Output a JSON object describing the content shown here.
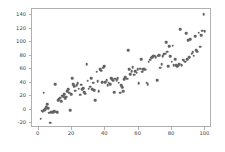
{
  "chart_data": {
    "type": "scatter",
    "title": "",
    "xlabel": "",
    "ylabel": "",
    "xlim": [
      -4.0,
      104.0
    ],
    "ylim": [
      -27.0,
      149.0
    ],
    "xticks": [
      0,
      20,
      40,
      60,
      80,
      100
    ],
    "yticks": [
      -20,
      0,
      20,
      40,
      60,
      80,
      100,
      120,
      140
    ],
    "xticklabels": [
      "0",
      "20",
      "40",
      "60",
      "80",
      "100"
    ],
    "yticklabels": [
      "-20",
      "0",
      "20",
      "40",
      "60",
      "80",
      "100",
      "120",
      "140"
    ],
    "grid": false,
    "legend": null,
    "marker": {
      "shape": "circle",
      "color": "#636363",
      "size": 2.6
    },
    "n_points": 150,
    "x": [
      1.2,
      1.8,
      2.4,
      3.0,
      3.4,
      4.0,
      4.6,
      5.2,
      5.8,
      6.2,
      6.8,
      7.4,
      8.0,
      8.6,
      9.2,
      9.8,
      10.4,
      11.0,
      11.6,
      12.2,
      12.8,
      13.4,
      14.0,
      14.6,
      15.2,
      15.8,
      16.4,
      17.0,
      17.6,
      18.2,
      19.0,
      19.6,
      20.2,
      20.8,
      21.4,
      22.0,
      22.8,
      23.4,
      24.0,
      24.8,
      25.4,
      26.0,
      26.8,
      27.4,
      28.0,
      28.8,
      29.4,
      30.0,
      30.8,
      31.4,
      32.0,
      32.8,
      33.4,
      34.0,
      34.8,
      35.4,
      36.0,
      36.8,
      37.4,
      38.0,
      38.8,
      39.4,
      40.0,
      40.8,
      41.4,
      42.0,
      42.8,
      43.4,
      44.0,
      44.8,
      45.4,
      46.0,
      46.8,
      47.4,
      48.0,
      48.8,
      49.4,
      50.0,
      50.8,
      51.4,
      52.0,
      53.0,
      53.8,
      54.4,
      55.0,
      55.8,
      56.4,
      57.2,
      58.0,
      58.8,
      59.4,
      60.0,
      60.8,
      61.4,
      62.0,
      62.8,
      63.4,
      64.0,
      64.8,
      65.4,
      66.0,
      66.8,
      67.4,
      68.0,
      68.8,
      69.4,
      70.2,
      71.0,
      71.8,
      72.4,
      73.0,
      73.8,
      74.4,
      75.0,
      75.8,
      76.4,
      77.0,
      77.8,
      78.4,
      79.0,
      79.8,
      80.4,
      81.0,
      81.8,
      82.4,
      83.0,
      83.8,
      84.4,
      85.0,
      85.8,
      86.4,
      87.0,
      87.8,
      88.4,
      89.0,
      89.8,
      90.4,
      91.0,
      91.8,
      92.4,
      93.0,
      93.8,
      94.4,
      95.2,
      96.0,
      96.8,
      97.4,
      98.2,
      99.0,
      99.6
    ],
    "y": [
      -13.0,
      -1.5,
      -2.0,
      25.0,
      -0.5,
      1.0,
      4.0,
      8.0,
      2.0,
      -4.5,
      -19.0,
      -3.5,
      -3.0,
      -4.0,
      -2.5,
      38.0,
      -3.0,
      -3.5,
      14.0,
      16.5,
      18.0,
      13.0,
      21.0,
      20.0,
      23.0,
      17.0,
      19.0,
      27.0,
      30.0,
      25.0,
      -0.5,
      23.0,
      47.0,
      38.0,
      35.0,
      28.0,
      36.0,
      39.0,
      31.0,
      22.0,
      37.0,
      30.0,
      32.0,
      26.0,
      24.0,
      67.0,
      43.0,
      31.0,
      34.0,
      47.0,
      30.0,
      40.0,
      29.0,
      14.5,
      56.0,
      42.0,
      27.0,
      60.0,
      58.0,
      41.0,
      62.0,
      64.0,
      41.0,
      44.0,
      36.0,
      40.0,
      38.0,
      47.0,
      45.0,
      43.0,
      26.0,
      46.0,
      44.0,
      47.0,
      40.0,
      25.0,
      36.0,
      33.0,
      27.0,
      45.0,
      48.0,
      46.0,
      88.0,
      60.0,
      53.0,
      57.0,
      63.0,
      52.0,
      57.0,
      55.0,
      60.0,
      39.0,
      61.0,
      75.0,
      56.0,
      60.0,
      61.0,
      59.0,
      40.0,
      38.0,
      71.0,
      74.0,
      77.0,
      78.0,
      79.0,
      80.0,
      78.0,
      44.0,
      80.0,
      81.0,
      62.0,
      67.0,
      79.0,
      82.0,
      83.0,
      100.0,
      86.0,
      64.0,
      94.0,
      79.0,
      71.0,
      95.0,
      66.0,
      75.0,
      66.0,
      64.0,
      65.0,
      67.0,
      119.0,
      66.0,
      74.0,
      73.0,
      71.0,
      113.0,
      75.0,
      103.0,
      78.0,
      104.0,
      83.0,
      85.0,
      80.0,
      109.0,
      88.0,
      86.0,
      114.0,
      93.0,
      110.0,
      117.0,
      141.0,
      116.0
    ]
  }
}
